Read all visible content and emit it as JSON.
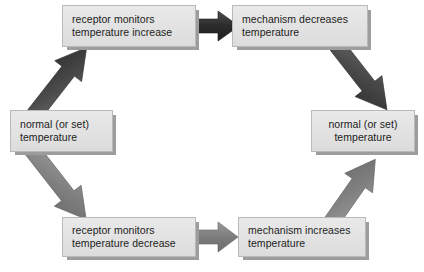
{
  "diagram": {
    "type": "cycle-flowchart",
    "colors": {
      "box_fill": "#e4e4e4",
      "box_border": "#b9b9b9",
      "box_shadow": "#9d9d9d",
      "arrow_dark": "#3b3b3b",
      "arrow_gray": "#7e7e7e",
      "text": "#1c1c1c",
      "background": "#ffffff"
    },
    "nodes": [
      {
        "id": "top-left",
        "name": "receptor-monitors-temperature-increase",
        "line1": "receptor monitors",
        "line2": "temperature increase",
        "align": "left",
        "x": 62,
        "y": 5,
        "w": 134,
        "h": 42
      },
      {
        "id": "top-right",
        "name": "mechanism-decreases-temperature",
        "line1": "mechanism decreases",
        "line2": "temperature",
        "align": "left",
        "x": 232,
        "y": 5,
        "w": 136,
        "h": 42
      },
      {
        "id": "left",
        "name": "normal-set-temperature-left",
        "line1": "normal (or set)",
        "line2": "temperature",
        "align": "left",
        "x": 10,
        "y": 110,
        "w": 103,
        "h": 42
      },
      {
        "id": "right",
        "name": "normal-set-temperature-right",
        "line1": "normal (or set)",
        "line2": "temperature",
        "align": "center",
        "x": 311,
        "y": 110,
        "w": 104,
        "h": 42
      },
      {
        "id": "bottom-left",
        "name": "receptor-monitors-temperature-decrease",
        "line1": "receptor monitors",
        "line2": "temperature decrease",
        "align": "left",
        "x": 62,
        "y": 217,
        "w": 134,
        "h": 40
      },
      {
        "id": "bottom-right",
        "name": "mechanism-increases-temperature",
        "line1": "mechanism increases",
        "line2": "temperature",
        "align": "left",
        "x": 238,
        "y": 217,
        "w": 128,
        "h": 40
      }
    ],
    "arrows": [
      {
        "id": "a1",
        "name": "arrow-left-to-top-left",
        "from": "left",
        "to": "top-left",
        "direction": "up-right",
        "shade": "dark"
      },
      {
        "id": "a2",
        "name": "arrow-top-left-to-top-right",
        "from": "top-left",
        "to": "top-right",
        "direction": "right",
        "shade": "dark"
      },
      {
        "id": "a3",
        "name": "arrow-top-right-to-right",
        "from": "top-right",
        "to": "right",
        "direction": "down-right",
        "shade": "dark"
      },
      {
        "id": "a4",
        "name": "arrow-left-to-bottom-left",
        "from": "left",
        "to": "bottom-left",
        "direction": "down-right",
        "shade": "gray"
      },
      {
        "id": "a5",
        "name": "arrow-bottom-left-to-bottom-right",
        "from": "bottom-left",
        "to": "bottom-right",
        "direction": "right",
        "shade": "gray"
      },
      {
        "id": "a6",
        "name": "arrow-bottom-right-to-right",
        "from": "bottom-right",
        "to": "right",
        "direction": "up-right",
        "shade": "gray"
      }
    ]
  }
}
